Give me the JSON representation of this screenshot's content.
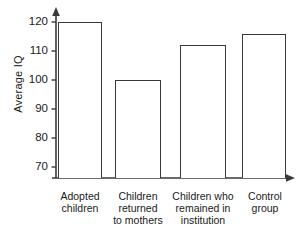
{
  "chart_data": {
    "type": "bar",
    "title": "",
    "xlabel": "",
    "ylabel": "Average IQ",
    "categories": [
      "Adopted children",
      "Children returned to mothers",
      "Children who remained in institution",
      "Control group"
    ],
    "category_lines": [
      [
        "Adopted",
        "children"
      ],
      [
        "Children",
        "returned",
        "to mothers"
      ],
      [
        "Children who",
        "remained in",
        "institution"
      ],
      [
        "Control",
        "group"
      ]
    ],
    "values": [
      120,
      100,
      112,
      116
    ],
    "ylim": [
      63,
      124
    ],
    "yticks": [
      70,
      80,
      90,
      100,
      110,
      120
    ],
    "ytick_labels": [
      "70",
      "80",
      "90",
      "100",
      "110",
      "120"
    ],
    "grid": false,
    "legend": null,
    "axis_broken": true,
    "bar_fill": "#ffffff",
    "bar_outline": "#3a3a3a",
    "axis_color": "#3a3a3a",
    "background": "#ffffff"
  },
  "axis": {
    "y_label": "Average IQ",
    "y_arrow": "up-arrow-icon",
    "x_arrow": "right-arrow-icon"
  }
}
